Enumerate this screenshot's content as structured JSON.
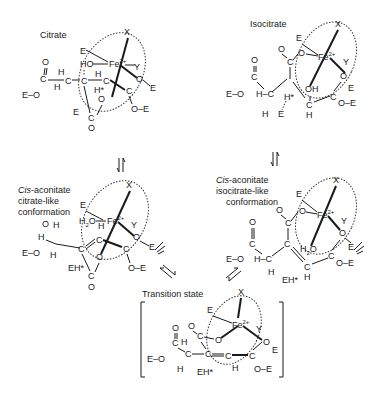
{
  "diagram": {
    "type": "reaction-mechanism",
    "structures": [
      {
        "id": "citrate",
        "title": "Citrate",
        "metal": "Fe",
        "metal_charge": "2+",
        "ligands": [
          "X",
          "Y",
          "E"
        ],
        "atoms": [
          "HO",
          "H",
          "H*",
          "O",
          "O–E",
          "E–O",
          "C",
          "E"
        ]
      },
      {
        "id": "isocitrate",
        "title": "Isocitrate",
        "metal": "Fe",
        "metal_charge": "2+",
        "ligands": [
          "X",
          "Y",
          "E"
        ],
        "atoms": [
          "O",
          "OH",
          "H*",
          "E",
          "O–E",
          "E–O",
          "H–C",
          "H"
        ]
      },
      {
        "id": "cis-aconitate-citrate-like",
        "title_italic": "Cis",
        "title_rest": "-aconitate",
        "subtitle1": "citrate-like",
        "subtitle2": "conformation",
        "metal": "Fe",
        "metal_charge": "2+",
        "ligands": [
          "X",
          "Y",
          "E"
        ],
        "atoms": [
          "H2O",
          "H",
          "EH*",
          "O–E",
          "E–O",
          "O"
        ]
      },
      {
        "id": "cis-aconitate-isocitrate-like",
        "title_italic": "Cis",
        "title_rest": "-aconitate",
        "subtitle1": "isocitrate-like",
        "subtitle2": "conformation",
        "metal": "Fe",
        "metal_charge": "2+",
        "ligands": [
          "X",
          "Y",
          "E"
        ],
        "atoms": [
          "H2O",
          "EH*",
          "O–E",
          "E–O",
          "H–C",
          "H"
        ]
      },
      {
        "id": "transition-state",
        "title": "Transition state",
        "metal": "Fe",
        "metal_charge": "2+",
        "ligands": [
          "X",
          "Y",
          "E"
        ],
        "atoms": [
          "EH*",
          "O–E",
          "E–O",
          "H",
          "O"
        ]
      }
    ],
    "equilibria": [
      {
        "from": "citrate",
        "to": "cis-aconitate-citrate-like",
        "direction": "vertical"
      },
      {
        "from": "isocitrate",
        "to": "cis-aconitate-isocitrate-like",
        "direction": "vertical"
      },
      {
        "from": "cis-aconitate-citrate-like",
        "to": "transition-state",
        "direction": "diagonal"
      },
      {
        "from": "cis-aconitate-isocitrate-like",
        "to": "transition-state",
        "direction": "diagonal"
      }
    ]
  },
  "labels": {
    "citrate": "Citrate",
    "isocitrate": "Isocitrate",
    "cis": "Cis",
    "aconitate": "-aconitate",
    "citrate_like": "citrate-like",
    "isocitrate_like": "isocitrate-like",
    "conformation": "conformation",
    "transition_state": "Transition state",
    "fe": "Fe",
    "charge": "2+",
    "x": "X",
    "y": "Y",
    "e": "E",
    "o": "O",
    "c": "C",
    "h": "H",
    "ho": "HO",
    "oh": "OH",
    "h2o_h": "H",
    "h2o_2": "2",
    "h2o_o": "O",
    "hstar": "H*",
    "ehstar": "EH*",
    "oe": "O–E",
    "eo": "E–O",
    "hc": "H–C"
  }
}
